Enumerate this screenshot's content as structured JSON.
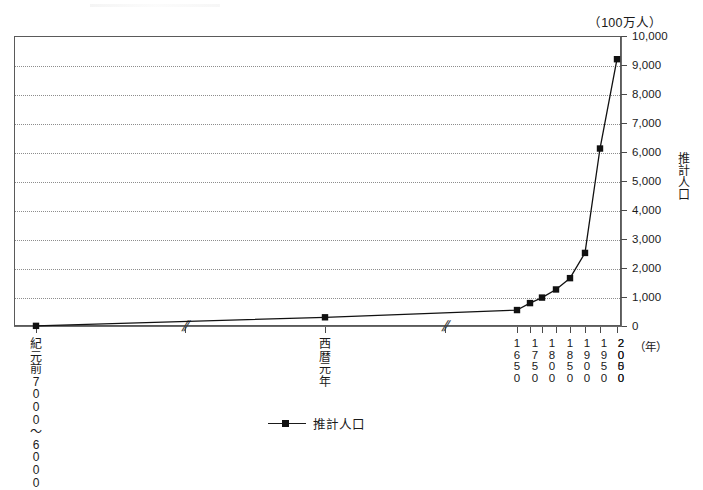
{
  "chart_data": {
    "type": "line",
    "title": "",
    "subtitle": "",
    "unit_label": "（100万人）",
    "xlabel": "（年）",
    "ylabel": "推計人口",
    "ylim": [
      0,
      10000
    ],
    "y_ticks": [
      0,
      1000,
      2000,
      3000,
      4000,
      5000,
      6000,
      7000,
      8000,
      9000,
      10000
    ],
    "y_tick_labels": [
      "0",
      "1,000",
      "2,000",
      "3,000",
      "4,000",
      "5,000",
      "6,000",
      "7,000",
      "8,000",
      "9,000",
      "10,000"
    ],
    "grid": true,
    "grid_style": "dotted-horizontal",
    "legend": [
      {
        "name": "推計人口",
        "marker": "square",
        "color": "#111111"
      }
    ],
    "legend_position": "bottom-center",
    "axis_breaks": [
      {
        "label": "//",
        "after_category": "紀元前7000〜6000"
      },
      {
        "label": "//",
        "after_category": "西暦元年"
      }
    ],
    "categories": [
      "紀元前7000〜6000",
      "西暦元年",
      "1650",
      "1750",
      "1800",
      "1850",
      "1900",
      "1950",
      "2000",
      "2050"
    ],
    "category_labels_vertical": [
      [
        "紀",
        "元",
        "前",
        "7",
        "0",
        "0",
        "0",
        "〜",
        "6",
        "0",
        "0",
        "0"
      ],
      [
        "西",
        "暦",
        "元",
        "年"
      ],
      [
        "1",
        "6",
        "5",
        "0"
      ],
      [
        "1",
        "7",
        "5",
        "0"
      ],
      [
        "1",
        "8",
        "0",
        "0"
      ],
      [
        "1",
        "8",
        "5",
        "0"
      ],
      [
        "1",
        "9",
        "0",
        "0"
      ],
      [
        "1",
        "9",
        "5",
        "0"
      ],
      [
        "2",
        "0",
        "0",
        "0"
      ],
      [
        "2",
        "0",
        "5",
        "0"
      ]
    ],
    "series": [
      {
        "name": "推計人口",
        "values": [
          5,
          300,
          550,
          790,
          980,
          1260,
          1650,
          2520,
          6120,
          9200
        ]
      }
    ]
  },
  "layout": {
    "plot": {
      "x": 14,
      "y": 36,
      "width": 607,
      "height": 290
    },
    "x_positions": [
      36,
      325,
      517,
      535,
      552,
      570,
      587,
      604,
      621,
      621
    ],
    "marker_x": [
      36,
      325,
      517,
      530,
      542,
      556,
      570,
      585,
      600,
      617
    ],
    "tick_x": [
      36,
      185,
      325,
      445,
      517,
      530,
      542,
      556,
      570,
      585,
      600,
      617
    ],
    "break_x": [
      185,
      445
    ]
  }
}
